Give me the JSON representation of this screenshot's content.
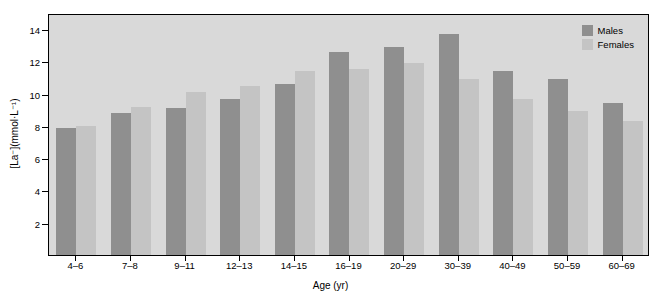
{
  "chart_data": {
    "type": "bar",
    "title": "",
    "xlabel": "Age (yr)",
    "ylabel": "[La⁻](mmol·L⁻¹)",
    "categories": [
      "4–6",
      "7–8",
      "9–11",
      "12–13",
      "14–15",
      "16–19",
      "20–29",
      "30–39",
      "40–49",
      "50–59",
      "60–69"
    ],
    "series": [
      {
        "name": "Males",
        "color": "#8f8f8f",
        "values": [
          7.9,
          8.8,
          9.1,
          9.7,
          10.6,
          12.6,
          12.9,
          13.7,
          11.4,
          10.9,
          9.4
        ]
      },
      {
        "name": "Females",
        "color": "#c4c4c4",
        "values": [
          8.0,
          9.2,
          10.1,
          10.5,
          11.4,
          11.5,
          11.9,
          10.9,
          9.7,
          8.9,
          8.3
        ]
      }
    ],
    "yticks": [
      2,
      4,
      6,
      8,
      10,
      12,
      14
    ],
    "ylim": [
      0,
      15
    ],
    "grid": false,
    "legend_position": "top-right",
    "plot_background": "#d9d9d9"
  },
  "legend": {
    "males_label": "Males",
    "females_label": "Females"
  },
  "axes": {
    "x_title": "Age (yr)",
    "y_title": "[La⁻](mmol·L⁻¹)"
  }
}
